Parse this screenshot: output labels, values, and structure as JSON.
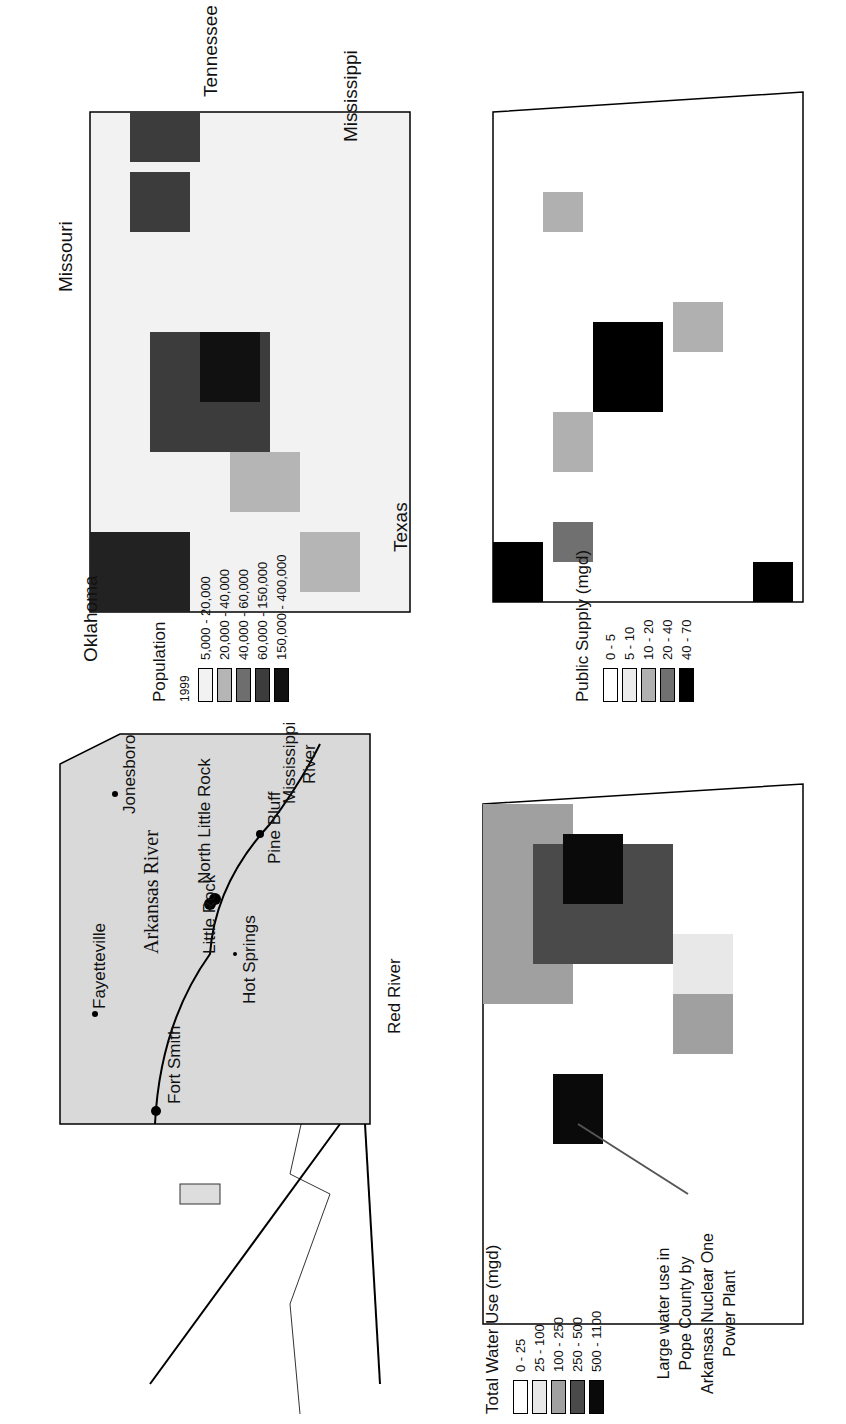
{
  "figure": {
    "orientation": "rotated 90 degrees counter-clockwise",
    "panels": [
      {
        "id": "location_map",
        "type": "reference map",
        "labels": {
          "rivers": [
            "Arkansas River",
            "Mississippi River",
            "Red River"
          ],
          "cities": [
            "Fayetteville",
            "Jonesboro",
            "Fort Smith",
            "Little Rock",
            "North Little Rock",
            "Hot Springs",
            "Pine Bluff"
          ]
        }
      },
      {
        "id": "population_map",
        "type": "choropleth",
        "legend": {
          "title": "Population",
          "year": "1999",
          "classes": [
            {
              "label": "5,000 - 20,000",
              "color": "#f2f2f2"
            },
            {
              "label": "20,000 - 40,000",
              "color": "#b5b5b5"
            },
            {
              "label": "40,000 - 60,000",
              "color": "#6e6e6e"
            },
            {
              "label": "60,000 - 150,000",
              "color": "#3c3c3c"
            },
            {
              "label": "150,000 - 400,000",
              "color": "#111111"
            }
          ]
        },
        "state_labels": [
          "Missouri",
          "Tennessee",
          "Mississippi",
          "Texas",
          "Oklahoma"
        ]
      },
      {
        "id": "total_water_use_map",
        "type": "choropleth",
        "legend": {
          "title": "Total Water Use (mgd)",
          "classes": [
            {
              "label": "0 - 25",
              "color": "#ffffff"
            },
            {
              "label": "25 - 100",
              "color": "#e8e8e8"
            },
            {
              "label": "100 - 250",
              "color": "#a0a0a0"
            },
            {
              "label": "250 - 500",
              "color": "#4a4a4a"
            },
            {
              "label": "500 - 1100",
              "color": "#0a0a0a"
            }
          ]
        },
        "annotation": "Large water use in Pope County by Arkansas Nuclear One Power Plant"
      },
      {
        "id": "public_supply_map",
        "type": "choropleth",
        "legend": {
          "title": "Public Supply (mgd)",
          "classes": [
            {
              "label": "0 - 5",
              "color": "#ffffff"
            },
            {
              "label": "5 - 10",
              "color": "#ececec"
            },
            {
              "label": "10 - 20",
              "color": "#b0b0b0"
            },
            {
              "label": "20 - 40",
              "color": "#707070"
            },
            {
              "label": "40 - 70",
              "color": "#000000"
            }
          ]
        }
      }
    ]
  },
  "labels": {
    "missouri": "Missouri",
    "tennessee": "Tennessee",
    "mississippi": "Mississippi",
    "texas": "Texas",
    "oklahoma": "Oklahoma",
    "arkansas_river": "Arkansas River",
    "mississippi_river_1": "Mississippi",
    "mississippi_river_2": "River",
    "red_river": "Red River",
    "fayetteville": "Fayetteville",
    "jonesboro": "Jonesboro",
    "fort_smith": "Fort Smith",
    "little_rock": "Little Rock",
    "north_little_rock": "North Little Rock",
    "hot_springs": "Hot Springs",
    "pine_bluff": "Pine Bluff",
    "annotation_1": "Large water use in",
    "annotation_2": "Pope County by",
    "annotation_3": "Arkansas Nuclear One",
    "annotation_4": "Power Plant"
  },
  "legends": {
    "population": {
      "year": "1999",
      "title": "Population",
      "items": [
        "5,000 - 20,000",
        "20,000 - 40,000",
        "40,000 - 60,000",
        "60,000 - 150,000",
        "150,000 - 400,000"
      ]
    },
    "water": {
      "title": "Total Water Use (mgd)",
      "items": [
        "0 - 25",
        "25 - 100",
        "100 - 250",
        "250 - 500",
        "500 - 1100"
      ]
    },
    "supply": {
      "title": "Public Supply (mgd)",
      "items": [
        "0 - 5",
        "5 - 10",
        "10 - 20",
        "20 - 40",
        "40 - 70"
      ]
    }
  }
}
